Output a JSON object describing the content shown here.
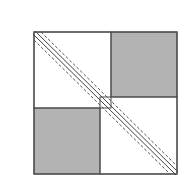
{
  "diagram": {
    "type": "quilt-block",
    "colors": {
      "background": "#ffffff",
      "outline": "#4a4a4a",
      "shaded": "#b3b3b3",
      "stitch": "#555555"
    },
    "outer_square": {
      "x": 34,
      "y": 32,
      "w": 143,
      "h": 142
    },
    "shaded_squares": [
      {
        "name": "top-right",
        "x": 111,
        "y": 32,
        "w": 66,
        "h": 65
      },
      {
        "name": "bottom-left",
        "x": 34,
        "y": 108,
        "w": 66,
        "h": 66
      }
    ],
    "diagonal": {
      "from": [
        34,
        32
      ],
      "to": [
        177,
        174
      ]
    }
  }
}
